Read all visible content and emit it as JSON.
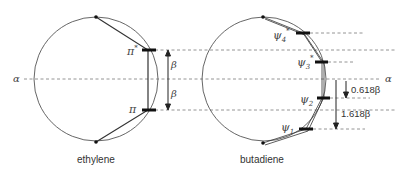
{
  "diagram": {
    "alpha_label": "α",
    "ethylene": {
      "caption": "ethylene",
      "orbitals": [
        {
          "label": "π",
          "superscript": "*"
        },
        {
          "label": "π",
          "superscript": ""
        }
      ],
      "gaps": [
        {
          "label": "β"
        },
        {
          "label": "β"
        }
      ]
    },
    "butadiene": {
      "caption": "butadiene",
      "orbitals": [
        {
          "label": "ψ",
          "subscript": "4",
          "superscript": "*"
        },
        {
          "label": "ψ",
          "subscript": "3",
          "superscript": "*"
        },
        {
          "label": "ψ",
          "subscript": "2",
          "superscript": ""
        },
        {
          "label": "ψ",
          "subscript": "1",
          "superscript": ""
        }
      ],
      "gaps": [
        {
          "label": "0.618β"
        },
        {
          "label": "1.618β"
        }
      ]
    }
  }
}
